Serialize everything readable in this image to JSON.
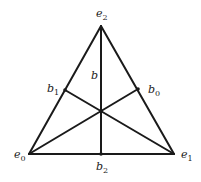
{
  "diagram": {
    "type": "barycentric-subdivision-triangle",
    "vertices": [
      {
        "id": "e0",
        "base": "e",
        "sub": "0",
        "x": 29,
        "y": 154,
        "label_x": 14,
        "label_y": 158
      },
      {
        "id": "e1",
        "base": "e",
        "sub": "1",
        "x": 174,
        "y": 154,
        "label_x": 181,
        "label_y": 158
      },
      {
        "id": "e2",
        "base": "e",
        "sub": "2",
        "x": 101,
        "y": 26,
        "label_x": 96,
        "label_y": 17
      }
    ],
    "edge_midpoints": [
      {
        "id": "b0",
        "base": "b",
        "sub": "0",
        "x": 138,
        "y": 89,
        "label_x": 148,
        "label_y": 93
      },
      {
        "id": "b1",
        "base": "b",
        "sub": "1",
        "x": 65,
        "y": 90,
        "label_x": 47,
        "label_y": 92
      },
      {
        "id": "b2",
        "base": "b",
        "sub": "2",
        "x": 101,
        "y": 154,
        "label_x": 96,
        "label_y": 170
      }
    ],
    "barycenter": {
      "id": "b",
      "base": "b",
      "sub": "",
      "x": 101,
      "y": 111,
      "label_x": 91,
      "label_y": 79
    },
    "triangle_edges": [
      [
        "e0",
        "e1"
      ],
      [
        "e1",
        "e2"
      ],
      [
        "e2",
        "e0"
      ]
    ],
    "medians": [
      [
        "e0",
        "b0"
      ],
      [
        "e1",
        "b1"
      ],
      [
        "e2",
        "b2"
      ]
    ]
  }
}
